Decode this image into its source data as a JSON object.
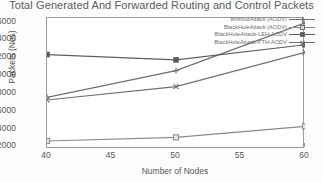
{
  "chart_data": {
    "type": "line",
    "title": "Total Generated And Forwarded Routing and Control Packets",
    "xlabel": "Number of Nodes",
    "ylabel": "Packets (Nos)",
    "x": [
      40,
      50,
      60
    ],
    "xticks": [
      "40",
      "45",
      "50",
      "55",
      "60"
    ],
    "xlim": [
      40,
      60
    ],
    "yticks": [
      "2000",
      "4000",
      "6000",
      "8000",
      "10000",
      "12000",
      "14000",
      "16000"
    ],
    "ylim": [
      1700,
      16400
    ],
    "grid": false,
    "legend_position": "top-right",
    "series": [
      {
        "name": "WithoutAttack (AODV)",
        "marker": "plus",
        "color": "#6f6f6f",
        "values": [
          7500,
          10500,
          15850
        ]
      },
      {
        "name": "BlackHoleAttack (AODV)",
        "marker": "square",
        "color": "#8a8a8a",
        "values": [
          2600,
          3000,
          4250
        ]
      },
      {
        "name": "BlackHoleAttack-LEH-AODV",
        "marker": "filled-square",
        "color": "#5d5d5d",
        "values": [
          12300,
          11700,
          13400
        ]
      },
      {
        "name": "BlackHoleAttack-PTH-AODV",
        "marker": "cross",
        "color": "#6f6f6f",
        "values": [
          7200,
          8700,
          12550
        ]
      }
    ]
  }
}
